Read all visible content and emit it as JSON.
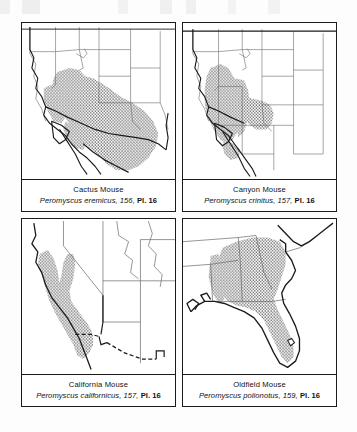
{
  "figure": {
    "kind": "field-guide-range-map-plate",
    "panel_count": 4,
    "shading_legend": "stippled gray = species range"
  },
  "panels": [
    {
      "position": "top-left",
      "common_name": "Cactus Mouse",
      "scientific_name": "Peromyscus eremicus",
      "page": "156",
      "plate": "Pl. 16",
      "separator": ", ",
      "map_region": "Southwestern United States and northern Mexico",
      "range_description": "Southern Nevada, southeastern California, Arizona, New Mexico, western Texas, Baja California and much of northern Mexico"
    },
    {
      "position": "top-right",
      "common_name": "Canyon Mouse",
      "scientific_name": "Peromyscus crinitus",
      "page": "157",
      "plate": "Pl. 16",
      "separator": ", ",
      "map_region": "Great Basin and intermountain western United States",
      "range_description": "Nevada, Utah, western Colorado, northern Arizona, eastern California, southern Idaho and southeastern Oregon"
    },
    {
      "position": "bottom-left",
      "common_name": "California Mouse",
      "scientific_name": "Peromyscus californicus",
      "page": "157",
      "plate": "Pl. 16",
      "separator": ", ",
      "map_region": "California and northern Baja California",
      "range_description": "Coastal and central California south into northwestern Baja California"
    },
    {
      "position": "bottom-right",
      "common_name": "Oldfield Mouse",
      "scientific_name": "Peromyscus polionotus",
      "page": "159",
      "plate": "Pl. 16",
      "separator": ", ",
      "map_region": "Southeastern United States",
      "range_description": "Alabama, Georgia, South Carolina, eastern Mississippi, Tennessee border and peninsular Florida"
    }
  ],
  "colors": {
    "range_shading": "#a8a8a8",
    "border": "#1a1a1a",
    "coastline": "#1a1a1a",
    "state_line": "#5a5a5a",
    "page_background": "#fdfdfd",
    "map_background": "#ffffff"
  }
}
